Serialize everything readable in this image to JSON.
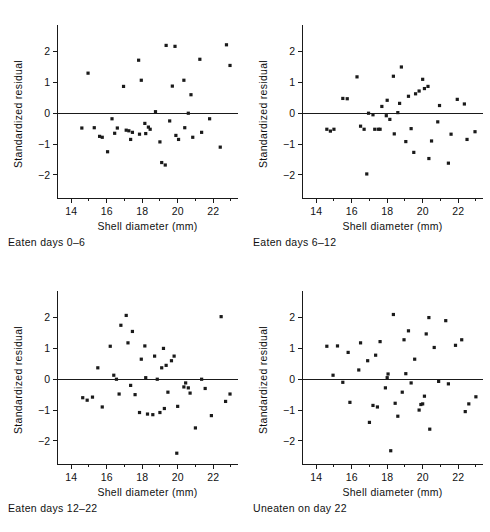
{
  "figure": {
    "type": "scatter-panel-grid",
    "rows": 2,
    "cols": 2,
    "marker_color": "#1a1a1a",
    "axis_color": "#1a1a1a",
    "background": "#ffffff"
  },
  "axes_common": {
    "xlabel": "Shell diameter (mm)",
    "ylabel": "Standardized residual",
    "xlim": [
      13.2,
      23.4
    ],
    "ylim": [
      -2.75,
      2.7
    ],
    "xticks": [
      14,
      16,
      18,
      20,
      22
    ],
    "xticklabels": [
      "14",
      "16",
      "18",
      "20",
      "22"
    ],
    "xminorticks": [
      13,
      15,
      17,
      19,
      21,
      23
    ],
    "yticks": [
      2,
      1,
      0,
      -1,
      -2
    ],
    "yticklabels": [
      "2",
      "1",
      "0",
      "−1",
      "−2"
    ],
    "grid": false,
    "legend": "none",
    "zero_reference_line": 0
  },
  "chart_data": [
    {
      "type": "scatter",
      "panel": "top-left",
      "title": "Eaten days 0–6",
      "xlabel": "Shell diameter (mm)",
      "ylabel": "Standardized residual",
      "xlim": [
        13.2,
        23.4
      ],
      "ylim": [
        -2.75,
        2.7
      ],
      "xticks": [
        14,
        16,
        18,
        20,
        22
      ],
      "yticks": [
        2,
        1,
        0,
        -1,
        -2
      ],
      "grid": false,
      "points": [
        {
          "x": 14.6,
          "y": -0.48
        },
        {
          "x": 14.95,
          "y": 1.3
        },
        {
          "x": 15.3,
          "y": -0.47
        },
        {
          "x": 15.6,
          "y": -0.75
        },
        {
          "x": 15.75,
          "y": -0.78
        },
        {
          "x": 16.05,
          "y": -1.25
        },
        {
          "x": 16.3,
          "y": -0.18
        },
        {
          "x": 16.45,
          "y": -0.65
        },
        {
          "x": 16.6,
          "y": -0.48
        },
        {
          "x": 16.95,
          "y": 0.87
        },
        {
          "x": 17.1,
          "y": -0.55
        },
        {
          "x": 17.25,
          "y": -0.57
        },
        {
          "x": 17.35,
          "y": -0.85
        },
        {
          "x": 17.45,
          "y": -0.62
        },
        {
          "x": 17.8,
          "y": 1.72
        },
        {
          "x": 17.85,
          "y": -0.68
        },
        {
          "x": 17.95,
          "y": 1.07
        },
        {
          "x": 18.15,
          "y": -0.33
        },
        {
          "x": 18.2,
          "y": -0.66
        },
        {
          "x": 18.35,
          "y": -0.45
        },
        {
          "x": 18.45,
          "y": -0.52
        },
        {
          "x": 18.75,
          "y": 0.05
        },
        {
          "x": 19.0,
          "y": -0.93
        },
        {
          "x": 19.1,
          "y": -1.6
        },
        {
          "x": 19.3,
          "y": -1.68
        },
        {
          "x": 19.35,
          "y": 2.2
        },
        {
          "x": 19.55,
          "y": -0.25
        },
        {
          "x": 19.7,
          "y": 0.88
        },
        {
          "x": 19.85,
          "y": 2.17
        },
        {
          "x": 19.9,
          "y": -0.72
        },
        {
          "x": 20.05,
          "y": -0.85
        },
        {
          "x": 20.35,
          "y": 1.07
        },
        {
          "x": 20.4,
          "y": -0.47
        },
        {
          "x": 20.6,
          "y": 0.0
        },
        {
          "x": 20.75,
          "y": 0.6
        },
        {
          "x": 20.85,
          "y": -0.78
        },
        {
          "x": 21.25,
          "y": 1.75
        },
        {
          "x": 21.35,
          "y": -0.62
        },
        {
          "x": 21.8,
          "y": -0.18
        },
        {
          "x": 22.4,
          "y": -1.1
        },
        {
          "x": 22.75,
          "y": 2.22
        },
        {
          "x": 22.95,
          "y": 1.55
        }
      ]
    },
    {
      "type": "scatter",
      "panel": "top-right",
      "title": "Eaten days 6–12",
      "xlabel": "Shell diameter (mm)",
      "ylabel": "Standardized residual",
      "xlim": [
        13.2,
        23.4
      ],
      "ylim": [
        -2.75,
        2.7
      ],
      "xticks": [
        14,
        16,
        18,
        20,
        22
      ],
      "yticks": [
        2,
        1,
        0,
        -1,
        -2
      ],
      "grid": false,
      "points": [
        {
          "x": 14.6,
          "y": -0.52
        },
        {
          "x": 14.8,
          "y": -0.58
        },
        {
          "x": 15.0,
          "y": -0.52
        },
        {
          "x": 15.5,
          "y": 0.48
        },
        {
          "x": 15.75,
          "y": 0.47
        },
        {
          "x": 16.3,
          "y": 1.18
        },
        {
          "x": 16.5,
          "y": -0.42
        },
        {
          "x": 16.7,
          "y": -0.52
        },
        {
          "x": 16.85,
          "y": -1.97
        },
        {
          "x": 16.95,
          "y": 0.0
        },
        {
          "x": 17.2,
          "y": -0.05
        },
        {
          "x": 17.3,
          "y": -0.52
        },
        {
          "x": 17.5,
          "y": -0.52
        },
        {
          "x": 17.6,
          "y": -0.52
        },
        {
          "x": 17.7,
          "y": 0.22
        },
        {
          "x": 17.95,
          "y": -0.08
        },
        {
          "x": 18.0,
          "y": 0.42
        },
        {
          "x": 18.15,
          "y": -0.2
        },
        {
          "x": 18.35,
          "y": 1.2
        },
        {
          "x": 18.4,
          "y": -0.67
        },
        {
          "x": 18.6,
          "y": 0.02
        },
        {
          "x": 18.7,
          "y": 0.32
        },
        {
          "x": 18.8,
          "y": 1.5
        },
        {
          "x": 19.05,
          "y": -0.92
        },
        {
          "x": 19.2,
          "y": 0.55
        },
        {
          "x": 19.35,
          "y": -0.5
        },
        {
          "x": 19.5,
          "y": -1.27
        },
        {
          "x": 19.6,
          "y": 0.63
        },
        {
          "x": 19.8,
          "y": 0.72
        },
        {
          "x": 20.0,
          "y": 1.1
        },
        {
          "x": 20.1,
          "y": 0.8
        },
        {
          "x": 20.3,
          "y": 0.87
        },
        {
          "x": 20.35,
          "y": -1.47
        },
        {
          "x": 20.5,
          "y": -0.9
        },
        {
          "x": 20.85,
          "y": -0.28
        },
        {
          "x": 20.95,
          "y": 0.25
        },
        {
          "x": 21.45,
          "y": -1.62
        },
        {
          "x": 21.6,
          "y": -0.68
        },
        {
          "x": 21.95,
          "y": 0.45
        },
        {
          "x": 22.35,
          "y": 0.3
        },
        {
          "x": 22.5,
          "y": -0.85
        },
        {
          "x": 22.95,
          "y": -0.6
        }
      ]
    },
    {
      "type": "scatter",
      "panel": "bottom-left",
      "title": "Eaten days 12–22",
      "xlabel": "Shell diameter (mm)",
      "ylabel": "Standardized residual",
      "xlim": [
        13.2,
        23.4
      ],
      "ylim": [
        -2.75,
        2.7
      ],
      "xticks": [
        14,
        16,
        18,
        20,
        22
      ],
      "yticks": [
        2,
        1,
        0,
        -1,
        -2
      ],
      "grid": false,
      "points": [
        {
          "x": 14.65,
          "y": -0.6
        },
        {
          "x": 14.9,
          "y": -0.68
        },
        {
          "x": 15.2,
          "y": -0.58
        },
        {
          "x": 15.5,
          "y": 0.37
        },
        {
          "x": 15.75,
          "y": -0.9
        },
        {
          "x": 16.2,
          "y": 1.07
        },
        {
          "x": 16.4,
          "y": 0.13
        },
        {
          "x": 16.55,
          "y": 0.0
        },
        {
          "x": 16.7,
          "y": -0.48
        },
        {
          "x": 16.8,
          "y": 1.75
        },
        {
          "x": 17.1,
          "y": 2.07
        },
        {
          "x": 17.2,
          "y": 1.18
        },
        {
          "x": 17.35,
          "y": -0.2
        },
        {
          "x": 17.45,
          "y": 1.55
        },
        {
          "x": 17.6,
          "y": -0.5
        },
        {
          "x": 17.85,
          "y": -1.08
        },
        {
          "x": 17.95,
          "y": 0.65
        },
        {
          "x": 18.15,
          "y": 1.08
        },
        {
          "x": 18.2,
          "y": 0.05
        },
        {
          "x": 18.3,
          "y": -1.13
        },
        {
          "x": 18.6,
          "y": -1.15
        },
        {
          "x": 18.7,
          "y": 0.75
        },
        {
          "x": 18.85,
          "y": 0.0
        },
        {
          "x": 19.0,
          "y": -1.08
        },
        {
          "x": 19.1,
          "y": 0.37
        },
        {
          "x": 19.2,
          "y": 1.0
        },
        {
          "x": 19.25,
          "y": -0.95
        },
        {
          "x": 19.35,
          "y": 0.45
        },
        {
          "x": 19.45,
          "y": -0.42
        },
        {
          "x": 19.65,
          "y": 0.6
        },
        {
          "x": 19.8,
          "y": 0.75
        },
        {
          "x": 19.95,
          "y": -2.4
        },
        {
          "x": 20.0,
          "y": -0.88
        },
        {
          "x": 20.35,
          "y": -0.25
        },
        {
          "x": 20.45,
          "y": -0.12
        },
        {
          "x": 20.6,
          "y": -0.28
        },
        {
          "x": 20.7,
          "y": -0.45
        },
        {
          "x": 21.0,
          "y": -1.58
        },
        {
          "x": 21.35,
          "y": 0.0
        },
        {
          "x": 21.55,
          "y": -0.3
        },
        {
          "x": 21.9,
          "y": -1.18
        },
        {
          "x": 22.45,
          "y": 2.03
        },
        {
          "x": 22.7,
          "y": -0.72
        },
        {
          "x": 22.95,
          "y": -0.48
        }
      ]
    },
    {
      "type": "scatter",
      "panel": "bottom-right",
      "title": "Uneaten on day 22",
      "xlabel": "Shell diameter (mm)",
      "ylabel": "Standardized residual",
      "xlim": [
        13.2,
        23.4
      ],
      "ylim": [
        -2.75,
        2.7
      ],
      "xticks": [
        14,
        16,
        18,
        20,
        22
      ],
      "yticks": [
        2,
        1,
        0,
        -1,
        -2
      ],
      "grid": false,
      "points": [
        {
          "x": 14.6,
          "y": 1.07
        },
        {
          "x": 14.95,
          "y": 0.13
        },
        {
          "x": 15.2,
          "y": 1.08
        },
        {
          "x": 15.5,
          "y": -0.1
        },
        {
          "x": 15.8,
          "y": 0.87
        },
        {
          "x": 15.9,
          "y": -0.75
        },
        {
          "x": 16.4,
          "y": 0.3
        },
        {
          "x": 16.5,
          "y": 1.18
        },
        {
          "x": 16.9,
          "y": 0.6
        },
        {
          "x": 17.0,
          "y": -1.4
        },
        {
          "x": 17.2,
          "y": -0.85
        },
        {
          "x": 17.35,
          "y": 0.78
        },
        {
          "x": 17.45,
          "y": -0.9
        },
        {
          "x": 17.6,
          "y": 1.22
        },
        {
          "x": 17.9,
          "y": -0.28
        },
        {
          "x": 18.0,
          "y": 0.05
        },
        {
          "x": 18.05,
          "y": 0.17
        },
        {
          "x": 18.2,
          "y": -2.32
        },
        {
          "x": 18.35,
          "y": 2.1
        },
        {
          "x": 18.45,
          "y": -0.78
        },
        {
          "x": 18.6,
          "y": -1.2
        },
        {
          "x": 18.85,
          "y": -0.42
        },
        {
          "x": 18.95,
          "y": 1.28
        },
        {
          "x": 19.05,
          "y": 0.18
        },
        {
          "x": 19.2,
          "y": 1.57
        },
        {
          "x": 19.35,
          "y": -0.12
        },
        {
          "x": 19.55,
          "y": 0.65
        },
        {
          "x": 19.8,
          "y": -1.0
        },
        {
          "x": 19.9,
          "y": -0.82
        },
        {
          "x": 20.0,
          "y": -0.8
        },
        {
          "x": 20.1,
          "y": -0.55
        },
        {
          "x": 20.2,
          "y": 1.47
        },
        {
          "x": 20.35,
          "y": 2.0
        },
        {
          "x": 20.4,
          "y": -1.62
        },
        {
          "x": 20.65,
          "y": 1.03
        },
        {
          "x": 20.9,
          "y": -0.07
        },
        {
          "x": 21.3,
          "y": 1.9
        },
        {
          "x": 21.45,
          "y": -0.15
        },
        {
          "x": 21.85,
          "y": 1.1
        },
        {
          "x": 22.2,
          "y": 1.28
        },
        {
          "x": 22.4,
          "y": -1.05
        },
        {
          "x": 22.6,
          "y": -0.8
        },
        {
          "x": 23.0,
          "y": -0.57
        }
      ]
    }
  ]
}
